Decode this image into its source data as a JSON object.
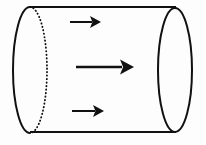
{
  "figure": {
    "canvas": {
      "width": 206,
      "height": 145,
      "background": "#fdfdfd"
    },
    "stroke_color": "#111111",
    "arrow_color": "#111111",
    "shapes": {
      "cylinder": {
        "name": "cylinder-body",
        "left_ellipse": {
          "name": "cylinder-left-cap",
          "cx": 30,
          "cy": 70,
          "rx": 17,
          "ry": 63,
          "front_arc_style": "solid",
          "back_arc_style": "dotted",
          "stroke_width": 2.0
        },
        "right_ellipse": {
          "name": "cylinder-right-cap",
          "cx": 175,
          "cy": 70,
          "rx": 17,
          "ry": 62,
          "style": "solid",
          "stroke_width": 2.0
        },
        "top_line": {
          "name": "cylinder-top-edge",
          "x1": 30,
          "y1": 7,
          "x2": 175,
          "y2": 7,
          "stroke_width": 2.2
        },
        "bottom_line": {
          "name": "cylinder-bottom-edge",
          "x1": 30,
          "y1": 132,
          "x2": 175,
          "y2": 132,
          "stroke_width": 2.2
        }
      },
      "arrows": [
        {
          "name": "flow-arrow-top",
          "label": "top flow arrow",
          "x1": 70,
          "y1": 22,
          "x2": 101,
          "y2": 22,
          "shaft_width": 2.0,
          "head_length": 11,
          "head_half_width": 6
        },
        {
          "name": "flow-arrow-middle",
          "label": "middle flow arrow",
          "x1": 76,
          "y1": 67,
          "x2": 134,
          "y2": 67,
          "shaft_width": 2.4,
          "head_length": 14,
          "head_half_width": 7.5
        },
        {
          "name": "flow-arrow-bottom",
          "label": "bottom flow arrow",
          "x1": 72,
          "y1": 111,
          "x2": 104,
          "y2": 111,
          "shaft_width": 2.0,
          "head_length": 11,
          "head_half_width": 6
        }
      ]
    }
  }
}
